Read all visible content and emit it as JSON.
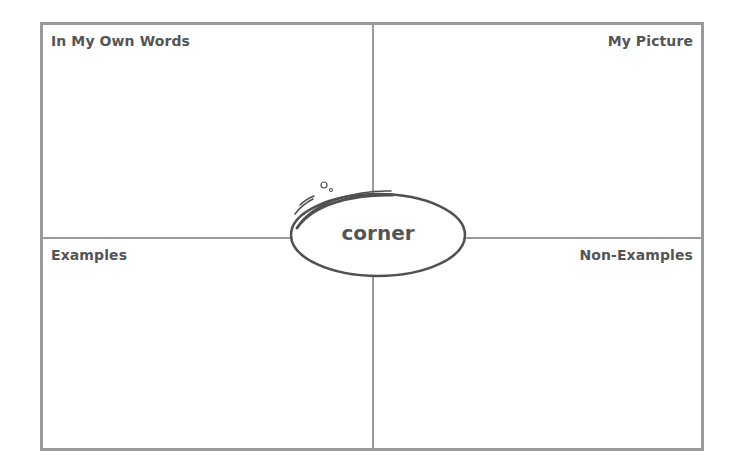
{
  "document": {
    "type": "vocabulary-organizer",
    "term": "corner",
    "quadrants": {
      "top_left": "In My Own Words",
      "top_right": "My Picture",
      "bottom_left": "Examples",
      "bottom_right": "Non-Examples"
    }
  },
  "colors": {
    "border": "#9a9a9a",
    "text": "#555555",
    "ellipse_stroke": "#505050",
    "background": "#ffffff"
  }
}
